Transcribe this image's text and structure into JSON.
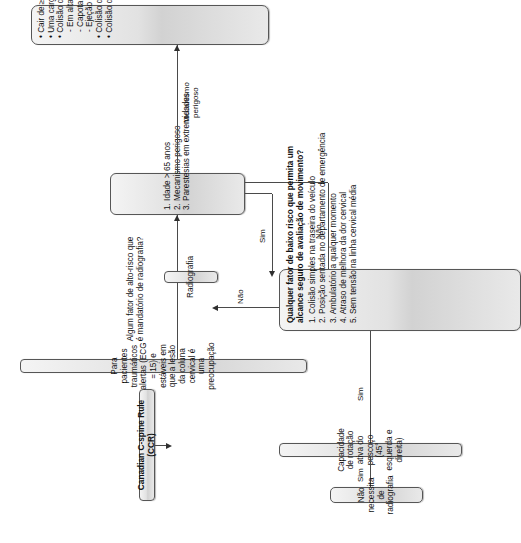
{
  "diagram": {
    "title_box": "Canadian C-spine Rule (CCR)",
    "population_box": "Para pacientes traumáticos alertas (ECG = 15) e estáveis em que a lesão da coluna cervical é uma preocupação",
    "question_high_risk": "Algum fator de alto-risco que\né mandatório de radiografia?",
    "high_risk_items": [
      "1. Idade > 65 anos",
      "2. Mecanismo perigoso",
      "3. Parestesias em extremidades"
    ],
    "dangerous_mechanism_items": [
      {
        "text": "• Cair de ≥ 1 m/5 degraus",
        "level": "bullet"
      },
      {
        "text": "• Uma carga axial para a cabeça",
        "level": "bullet"
      },
      {
        "text": "• Colisão de veículo motor:",
        "level": "bullet"
      },
      {
        "text": "- Em alta velocidade (> 100 km/h)",
        "level": "sub"
      },
      {
        "text": "- Capotamento",
        "level": "sub"
      },
      {
        "text": "- Ejeção",
        "level": "sub"
      },
      {
        "text": "• Colisão de veículos recreacionais",
        "level": "bullet"
      },
      {
        "text": "• Colisão de bicicleta",
        "level": "bullet"
      }
    ],
    "radiografia_box": "Radiografia",
    "low_risk_header": "Qualquer fator de baixo risco que permita um alcance seguro de avaliação de movimento?",
    "low_risk_items": [
      "1. Colisão simples na traseira do veículo",
      "2. Posição sentada no departamento de emergência",
      "3. Ambulatório a qualquer momento",
      "4. Atraso de melhora da dor cervical",
      "5. Sem tensão na linha cervical média"
    ],
    "rotation_box": "Capacidade de rotação ativa do pescoço (45° esquerda e direita)",
    "no_xray_box": "Não necessita de radiografia",
    "edges": {
      "mechanism_label": "Mecanismo\nperigoso",
      "highrisk_yes": "Sim",
      "highrisk_no": "Não",
      "lowrisk_no": "Não",
      "lowrisk_yes": "Sim",
      "rotation_yes": "Sim"
    },
    "colors": {
      "node_border": "#565656",
      "node_fill_top": "#f4f4f4",
      "node_fill_bottom": "#e9e9e9",
      "connector": "#4a4a4a",
      "text": "#111111",
      "background": "#ffffff"
    }
  }
}
